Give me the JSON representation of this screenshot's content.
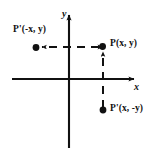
{
  "figure": {
    "background_color": "#ffffff",
    "ink_color": "#111111",
    "width": 162,
    "height": 156
  },
  "axes": {
    "x_label": "x",
    "y_label": "y",
    "origin": {
      "x": 69,
      "y": 79
    },
    "x_axis": {
      "start_x": 12,
      "end_x": 137,
      "y": 79,
      "arrow": "right"
    },
    "y_axis": {
      "x": 69,
      "start_y": 148,
      "end_y": 12,
      "arrow": "up"
    }
  },
  "points": [
    {
      "id": "p-reflect-y",
      "label": "P'(-x, y)",
      "dot": {
        "x": 36,
        "y": 48
      },
      "quadrant": "II"
    },
    {
      "id": "p",
      "label": "P(x, y)",
      "dot": {
        "x": 102,
        "y": 46
      },
      "quadrant": "I"
    },
    {
      "id": "p-reflect-x",
      "label": "P'(x, -y)",
      "dot": {
        "x": 103,
        "y": 110
      },
      "quadrant": "IV"
    }
  ],
  "connectors": [
    {
      "id": "horizontal-dashed",
      "style": "dashed",
      "from": {
        "x": 102,
        "y": 47
      },
      "to": {
        "x": 37,
        "y": 47
      },
      "arrows": "both"
    },
    {
      "id": "vertical-dashed",
      "style": "dashed",
      "from": {
        "x": 103,
        "y": 109
      },
      "to": {
        "x": 103,
        "y": 47
      },
      "arrows": "up"
    }
  ]
}
